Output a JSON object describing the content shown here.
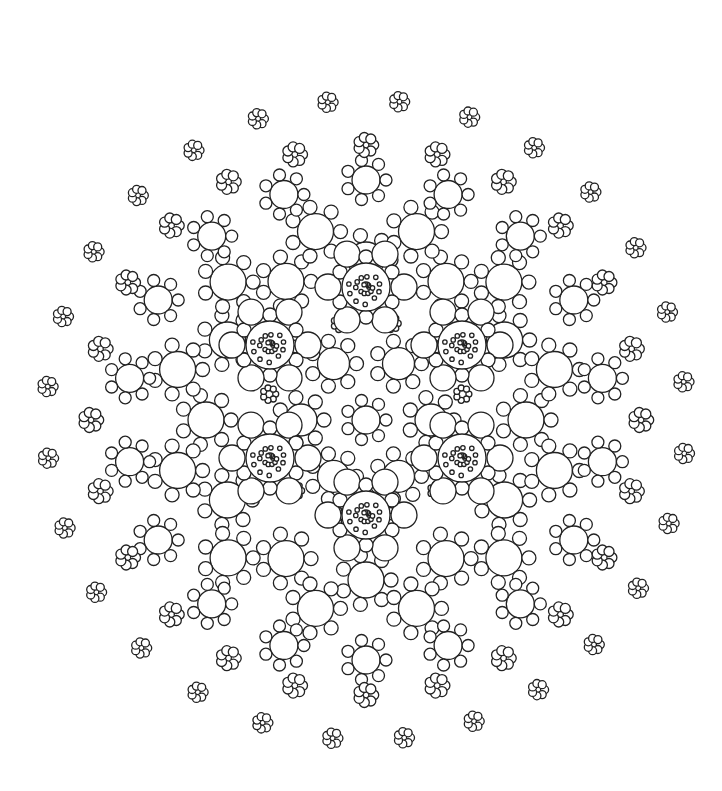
{
  "artwork": {
    "type": "mandala-coloring-page",
    "background": "#ffffff",
    "stroke": "#222222",
    "center": [
      366,
      420
    ],
    "large_flowers": [
      {
        "cx": 366,
        "cy": 287
      },
      {
        "cx": 462,
        "cy": 345
      },
      {
        "cx": 462,
        "cy": 458
      },
      {
        "cx": 366,
        "cy": 515
      },
      {
        "cx": 270,
        "cy": 458
      },
      {
        "cx": 270,
        "cy": 345
      }
    ],
    "rings": [
      {
        "radius": 65,
        "count": 6,
        "offset": 0,
        "kind": "ring",
        "r": 16,
        "bead": 7
      },
      {
        "radius": 100,
        "count": 12,
        "offset": 15,
        "kind": "small",
        "r": 9,
        "bead": 3
      },
      {
        "radius": 160,
        "count": 12,
        "offset": 0,
        "kind": "ring",
        "r": 18,
        "bead": 7
      },
      {
        "radius": 195,
        "count": 12,
        "offset": 15,
        "kind": "ring",
        "r": 18,
        "bead": 7
      },
      {
        "radius": 240,
        "count": 18,
        "offset": 10,
        "kind": "ring",
        "r": 14,
        "bead": 6
      },
      {
        "radius": 275,
        "count": 24,
        "offset": 0,
        "kind": "small",
        "r": 11,
        "bead": 5
      },
      {
        "radius": 320,
        "count": 28,
        "offset": 6,
        "kind": "small",
        "r": 9,
        "bead": 4
      }
    ]
  }
}
